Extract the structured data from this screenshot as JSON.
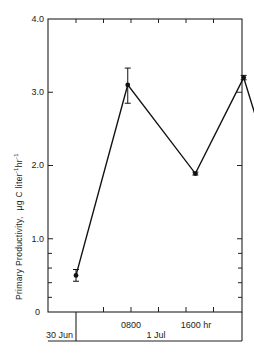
{
  "chart_data": {
    "type": "line",
    "title": "",
    "xlabel": "",
    "ylabel": "Primary Productivity, µg C liter⁻¹hr⁻¹",
    "ylabel_main": "Primary Productivity,",
    "ylabel_unit": "µg C liter",
    "ylabel_sup1": "-1",
    "ylabel_hr": "hr",
    "ylabel_sup2": "-1",
    "ylim": [
      0,
      4.0
    ],
    "y_ticks": [
      "0",
      "1.0",
      "2.0",
      "3.0",
      "4.0"
    ],
    "x_tick_labels": [
      "0800",
      "1600 hr"
    ],
    "date_labels": [
      "30 Jun",
      "1 Jul"
    ],
    "grid": false,
    "legend": null,
    "series": [
      {
        "name": "Primary Productivity",
        "x_hours": [
          0,
          7.5,
          17.3,
          24.3,
          31.8
        ],
        "values": [
          0.5,
          3.1,
          1.89,
          3.2,
          0.9
        ],
        "error_low": [
          0.42,
          2.85,
          1.87,
          3.17,
          0.5
        ],
        "error_high": [
          0.58,
          3.33,
          1.91,
          3.23,
          1.28
        ]
      }
    ]
  }
}
